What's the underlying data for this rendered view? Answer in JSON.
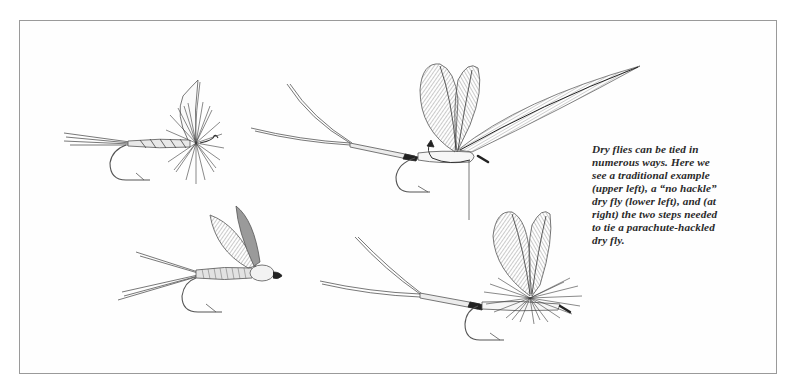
{
  "figure": {
    "caption_lines": [
      "Dry flies can be tied in",
      "numerous ways. Here we",
      "see a traditional example",
      "(upper left), a “no hackle”",
      "dry fly (lower left), and (at",
      "right) the two steps needed",
      "to tie a parachute-hackled",
      "dry fly."
    ],
    "illustrations": [
      {
        "id": "traditional-dry-fly",
        "position": "upper left",
        "label": "traditional dry fly"
      },
      {
        "id": "parachute-step-1",
        "position": "upper right",
        "label": "parachute-hackled dry fly, step 1"
      },
      {
        "id": "no-hackle-dry-fly",
        "position": "lower left",
        "label": "no hackle dry fly"
      },
      {
        "id": "parachute-step-2",
        "position": "lower right",
        "label": "parachute-hackled dry fly, step 2"
      }
    ],
    "colors": {
      "ink": "#2a2a2a",
      "line": "#555555",
      "frame": "#9a9a9a",
      "background": "#fefefe"
    }
  }
}
